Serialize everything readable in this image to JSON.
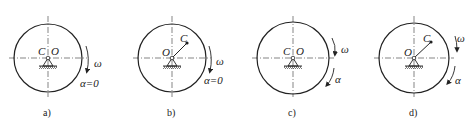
{
  "figure": {
    "panels": [
      {
        "id": "a",
        "caption": "a)",
        "center_label": "O",
        "mass_label": "C",
        "offset": false,
        "omega_label": "ω",
        "alpha_label": "α=0",
        "alpha_zero": true
      },
      {
        "id": "b",
        "caption": "b)",
        "center_label": "O",
        "mass_label": "C",
        "offset": true,
        "omega_label": "ω",
        "alpha_label": "α=0",
        "alpha_zero": true
      },
      {
        "id": "c",
        "caption": "c)",
        "center_label": "O",
        "mass_label": "C",
        "offset": false,
        "omega_label": "ω",
        "alpha_label": "α",
        "alpha_zero": false
      },
      {
        "id": "d",
        "caption": "d)",
        "center_label": "O",
        "mass_label": "C",
        "offset": true,
        "omega_label": "ω",
        "alpha_label": "α",
        "alpha_zero": false
      }
    ],
    "colors": {
      "stroke": "#222222",
      "background": "#ffffff"
    }
  }
}
